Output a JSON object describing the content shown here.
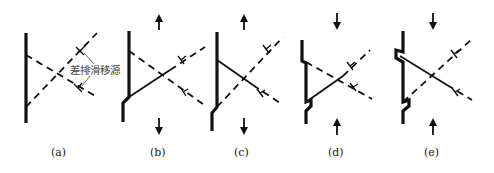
{
  "figure": {
    "annotation": "差排滑移源",
    "panels": [
      {
        "id": "a",
        "label": "(a)",
        "stress": "none"
      },
      {
        "id": "b",
        "label": "(b)",
        "stress": "tension"
      },
      {
        "id": "c",
        "label": "(c)",
        "stress": "tension"
      },
      {
        "id": "d",
        "label": "(d)",
        "stress": "compression"
      },
      {
        "id": "e",
        "label": "(e)",
        "stress": "compression"
      }
    ],
    "icons": {
      "tension": "arrow-up-top / arrow-down-bottom",
      "compression": "arrow-down-top / arrow-up-bottom",
      "dislocation": "dislocation-symbol"
    },
    "colors": {
      "line": "#111111",
      "background": "#ffffff"
    }
  }
}
